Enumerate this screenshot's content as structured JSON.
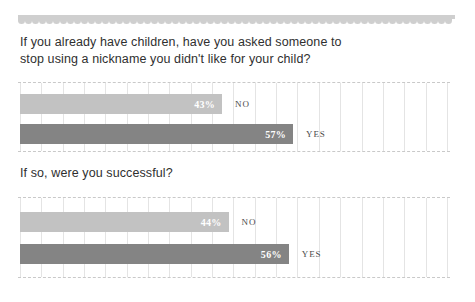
{
  "decoration": {
    "scallop_band": "scalloped-border",
    "scallop_color": "#cfcfcf",
    "scallop_count": 62
  },
  "colors": {
    "bar_no": "#c2c2c2",
    "bar_yes": "#848484",
    "gridline": "#e4e4e4",
    "dashed_rule": "#c9c9c9",
    "heading_text": "#2f2f2f",
    "value_text": "#ffffff",
    "category_text": "#4a4a4a"
  },
  "sections": [
    {
      "heading": "If you already have children, have you asked someone to stop using a nickname you didn't like for your child?",
      "chart_data": {
        "type": "bar",
        "orientation": "horizontal",
        "title": "If you already have children, have you asked someone to stop using a nickname you didn't like for your child?",
        "categories": [
          "NO",
          "YES"
        ],
        "values": [
          43,
          57
        ],
        "value_labels": [
          "43%",
          "57%"
        ],
        "xlabel": "",
        "ylabel": "",
        "xlim": [
          0,
          100
        ],
        "grid": true,
        "gridlines": 20,
        "legend": "none",
        "series": [
          {
            "name": "NO",
            "value": 43,
            "label": "43%",
            "color": "#c2c2c2"
          },
          {
            "name": "YES",
            "value": 57,
            "label": "57%",
            "color": "#848484"
          }
        ]
      }
    },
    {
      "heading": "If so, were you successful?",
      "chart_data": {
        "type": "bar",
        "orientation": "horizontal",
        "title": "If so, were you successful?",
        "categories": [
          "NO",
          "YES"
        ],
        "values": [
          44,
          56
        ],
        "value_labels": [
          "44%",
          "56%"
        ],
        "xlabel": "",
        "ylabel": "",
        "xlim": [
          0,
          100
        ],
        "grid": true,
        "gridlines": 20,
        "legend": "none",
        "series": [
          {
            "name": "NO",
            "value": 44,
            "label": "44%",
            "color": "#c2c2c2"
          },
          {
            "name": "YES",
            "value": 56,
            "label": "56%",
            "color": "#848484"
          }
        ]
      }
    }
  ]
}
